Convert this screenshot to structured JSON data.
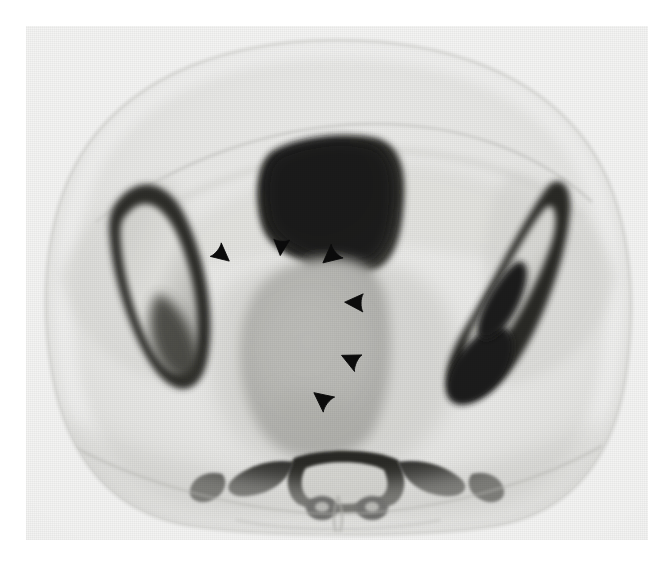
{
  "figure": {
    "modality": "CT",
    "plane": "axial",
    "body_region": "pelvis",
    "background_color": "#ffffff",
    "plate": {
      "x": 26,
      "y": 26,
      "width": 622,
      "height": 514,
      "base_tone": "#f1f1f0"
    },
    "palette": {
      "paper_white": "#f6f6f5",
      "subcutaneous_fat": "#e9e9e7",
      "muscle_gray": "#c9c9c6",
      "soft_tissue_gray": "#bdbdba",
      "mass_gray": "#b4b4b0",
      "bone_marrow": "#d8d8d4",
      "bone_cortex": "#2e2e2c",
      "bowel_gas": "#23221f",
      "marker_black": "#0b0b0b"
    }
  },
  "anatomy": {
    "body_contour": {
      "label": "body-contour",
      "description": "oval abdominal wall cross-section"
    },
    "structures": [
      {
        "name": "right-iliac-bone",
        "label": "Right iliac bone",
        "tone": "#d8d8d4",
        "cortex": "#2f2f2d"
      },
      {
        "name": "left-iliac-bone",
        "label": "Left iliac bone",
        "tone": "#d2d2ce",
        "cortex": "#262624"
      },
      {
        "name": "bowel-gas-collection",
        "label": "Bowel / rectosigmoid gas",
        "tone": "#232320"
      },
      {
        "name": "central-pelvic-mass",
        "label": "Central pelvic mass",
        "tone": "#b6b6b2"
      },
      {
        "name": "sacrum",
        "label": "Sacrum",
        "tone": "#2a2a28"
      },
      {
        "name": "gluteal-muscles",
        "label": "Gluteal musculature",
        "tone": "#c6c6c3"
      },
      {
        "name": "subcutaneous-fat",
        "label": "Subcutaneous fat",
        "tone": "#eaeae8"
      }
    ]
  },
  "annotations": {
    "marker_glyph": "arrowhead",
    "marker_color": "#0b0b0b",
    "count": 6,
    "caption": "Arrowheads outline the margins of the central pelvic mass",
    "markers": [
      {
        "id": "arrowhead-1",
        "x": 222,
        "y": 255,
        "size": 24,
        "rotation": 40,
        "note": "anterior-right margin"
      },
      {
        "id": "arrowhead-2",
        "x": 281,
        "y": 247,
        "size": 22,
        "rotation": 95,
        "note": "anterior margin"
      },
      {
        "id": "arrowhead-3",
        "x": 330,
        "y": 256,
        "size": 25,
        "rotation": 140,
        "note": "anterior-left margin"
      },
      {
        "id": "arrowhead-4",
        "x": 354,
        "y": 302,
        "size": 25,
        "rotation": 182,
        "note": "left lateral margin"
      },
      {
        "id": "arrowhead-5",
        "x": 350,
        "y": 359,
        "size": 25,
        "rotation": 205,
        "note": "posterior-left margin"
      },
      {
        "id": "arrowhead-6",
        "x": 322,
        "y": 399,
        "size": 26,
        "rotation": 218,
        "note": "posterior margin"
      }
    ]
  }
}
